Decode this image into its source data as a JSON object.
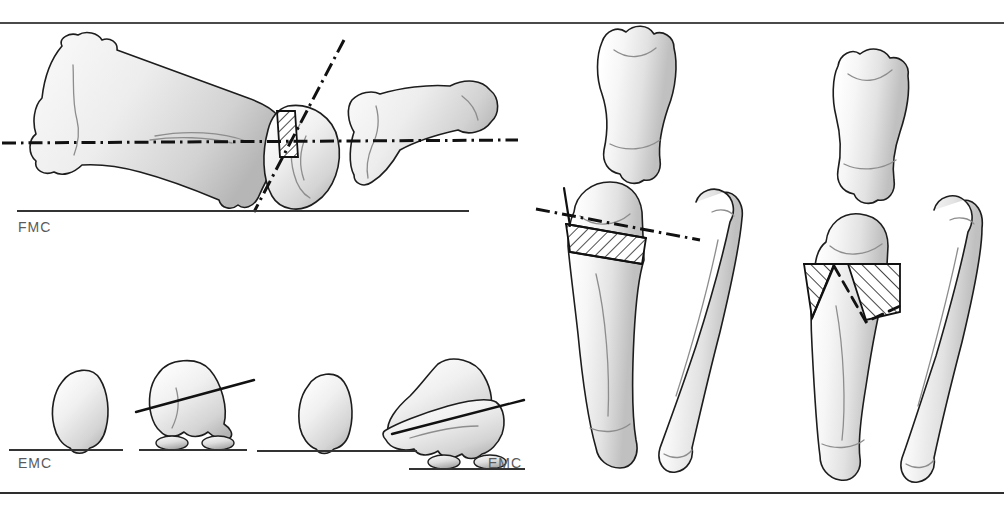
{
  "figure": {
    "background_color": "#ffffff",
    "rule_color": "#4a4a4a",
    "bone_outline_color": "#1d1d1d",
    "bone_fill_color": "#f2f2f2",
    "bone_shade_color": "#c9c9c9",
    "hatch_color": "#111111",
    "axis_line_color": "#111111"
  },
  "labels": {
    "lateral_view": "FMC",
    "frontal_view_left": "EMC",
    "frontal_view_right": "EMC"
  },
  "panels": {
    "lateral": {
      "name": "lateral-oblique-view",
      "caption": "FMC",
      "elements": [
        "long-metacarpal-bone",
        "hatched-wedge-osteotomy",
        "horizontal-joint-axis-dash-dot",
        "oblique-osteotomy-axis-dash-dot",
        "proximal-phalanx",
        "ground-reference-line"
      ]
    },
    "condyle_series": {
      "name": "condyle-end-on-series",
      "caption": "EMC",
      "views": [
        "upright-condyle-no-sesamoids",
        "tilted-condyle-with-sesamoids-and-tilt-line",
        "upright-condyle-repeat",
        "corrected-condyle-with-sesamoids-and-tilt-line"
      ]
    },
    "frontal_pre": {
      "name": "frontal-view-preoperative",
      "caption": "EMC",
      "elements": [
        "proximal-phalanx",
        "metacarpal-with-hatched-wedge",
        "splint-bone",
        "joint-axis-dash-dot"
      ]
    },
    "frontal_post": {
      "name": "frontal-view-postoperative",
      "caption": "",
      "elements": [
        "proximal-phalanx",
        "metacarpal-with-removed-wedge",
        "hatched-resection-zones",
        "dashed-repositioning-outline",
        "splint-bone"
      ]
    }
  }
}
